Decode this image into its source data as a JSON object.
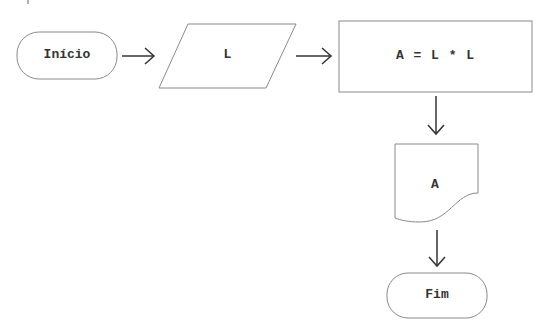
{
  "flowchart": {
    "nodes": [
      {
        "id": "start",
        "type": "terminator",
        "label": "Início"
      },
      {
        "id": "input",
        "type": "data-input",
        "label": "L"
      },
      {
        "id": "process",
        "type": "process",
        "label": "A = L * L"
      },
      {
        "id": "output",
        "type": "document",
        "label": "A"
      },
      {
        "id": "end",
        "type": "terminator",
        "label": "Fim"
      }
    ],
    "edges": [
      {
        "from": "start",
        "to": "input",
        "direction": "right"
      },
      {
        "from": "input",
        "to": "process",
        "direction": "right"
      },
      {
        "from": "process",
        "to": "output",
        "direction": "down"
      },
      {
        "from": "output",
        "to": "end",
        "direction": "down"
      }
    ],
    "colors": {
      "stroke": "#8a8a8a",
      "arrow": "#333333",
      "text": "#333333",
      "background": "#ffffff"
    }
  }
}
